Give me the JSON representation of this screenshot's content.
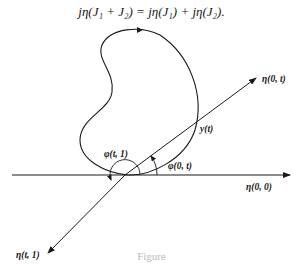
{
  "equation": {
    "text": "jη(J₁ + J₂) = jη(J₁) + jη(J₂)."
  },
  "figure": {
    "labels": {
      "eta_0_t": "η(0, t)",
      "y_t": "y(t)",
      "phi_0_t": "φ(0, t)",
      "phi_t_1": "φ(t, 1)",
      "eta_0_0": "η(0, 0)",
      "eta_t_1": "η(t, 1)"
    },
    "caption": "Figure"
  }
}
